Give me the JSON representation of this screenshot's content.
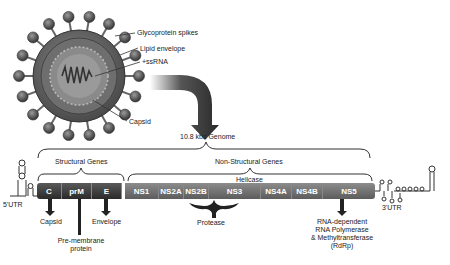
{
  "virion": {
    "labels": {
      "spikes": "Glycoprotein spikes",
      "envelope": "Lipid envelope",
      "rna": "+ssRNA",
      "capsid": "Capsid"
    }
  },
  "genome": {
    "title": "10.8 kbs Genome",
    "structural_label": "Structural Genes",
    "nonstructural_label": "Non-Structural Genes",
    "utr5": "5'UTR",
    "utr3": "3'UTR",
    "genes": [
      {
        "name": "C",
        "type": "structural"
      },
      {
        "name": "prM",
        "type": "structural"
      },
      {
        "name": "E",
        "type": "structural"
      },
      {
        "name": "NS1",
        "type": "nonstructural"
      },
      {
        "name": "NS2A",
        "type": "nonstructural"
      },
      {
        "name": "NS2B",
        "type": "nonstructural"
      },
      {
        "name": "NS3",
        "type": "nonstructural"
      },
      {
        "name": "NS4A",
        "type": "nonstructural"
      },
      {
        "name": "NS4B",
        "type": "nonstructural"
      },
      {
        "name": "NS5",
        "type": "nonstructural"
      }
    ],
    "annotations": {
      "helicase": "Helicase",
      "protease": "Protease",
      "capsid": "Capsid",
      "premembrane_line1": "Pre-membrane",
      "premembrane_line2": "protein",
      "envelope": "Envelope",
      "rdrp_line1": "RNA-dependent",
      "rdrp_line2": "RNA Polymerase",
      "rdrp_line3": "& Methyltransferase",
      "rdrp_line4": "(RdRp)"
    }
  },
  "colors": {
    "structural": "#3a3a3a",
    "nonstructural": "#777777",
    "arrow": "#333333"
  }
}
